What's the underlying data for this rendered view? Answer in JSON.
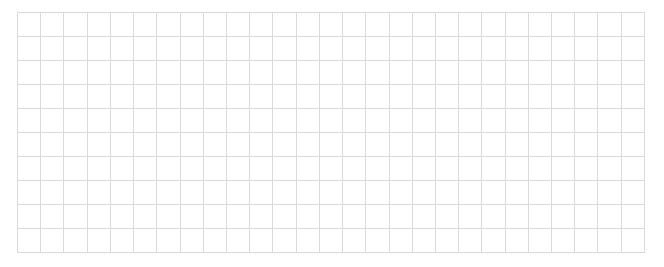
{
  "grid": {
    "rows": 10,
    "columns": 27,
    "line_color": "#dadada",
    "background_color": "#ffffff",
    "cells": []
  }
}
